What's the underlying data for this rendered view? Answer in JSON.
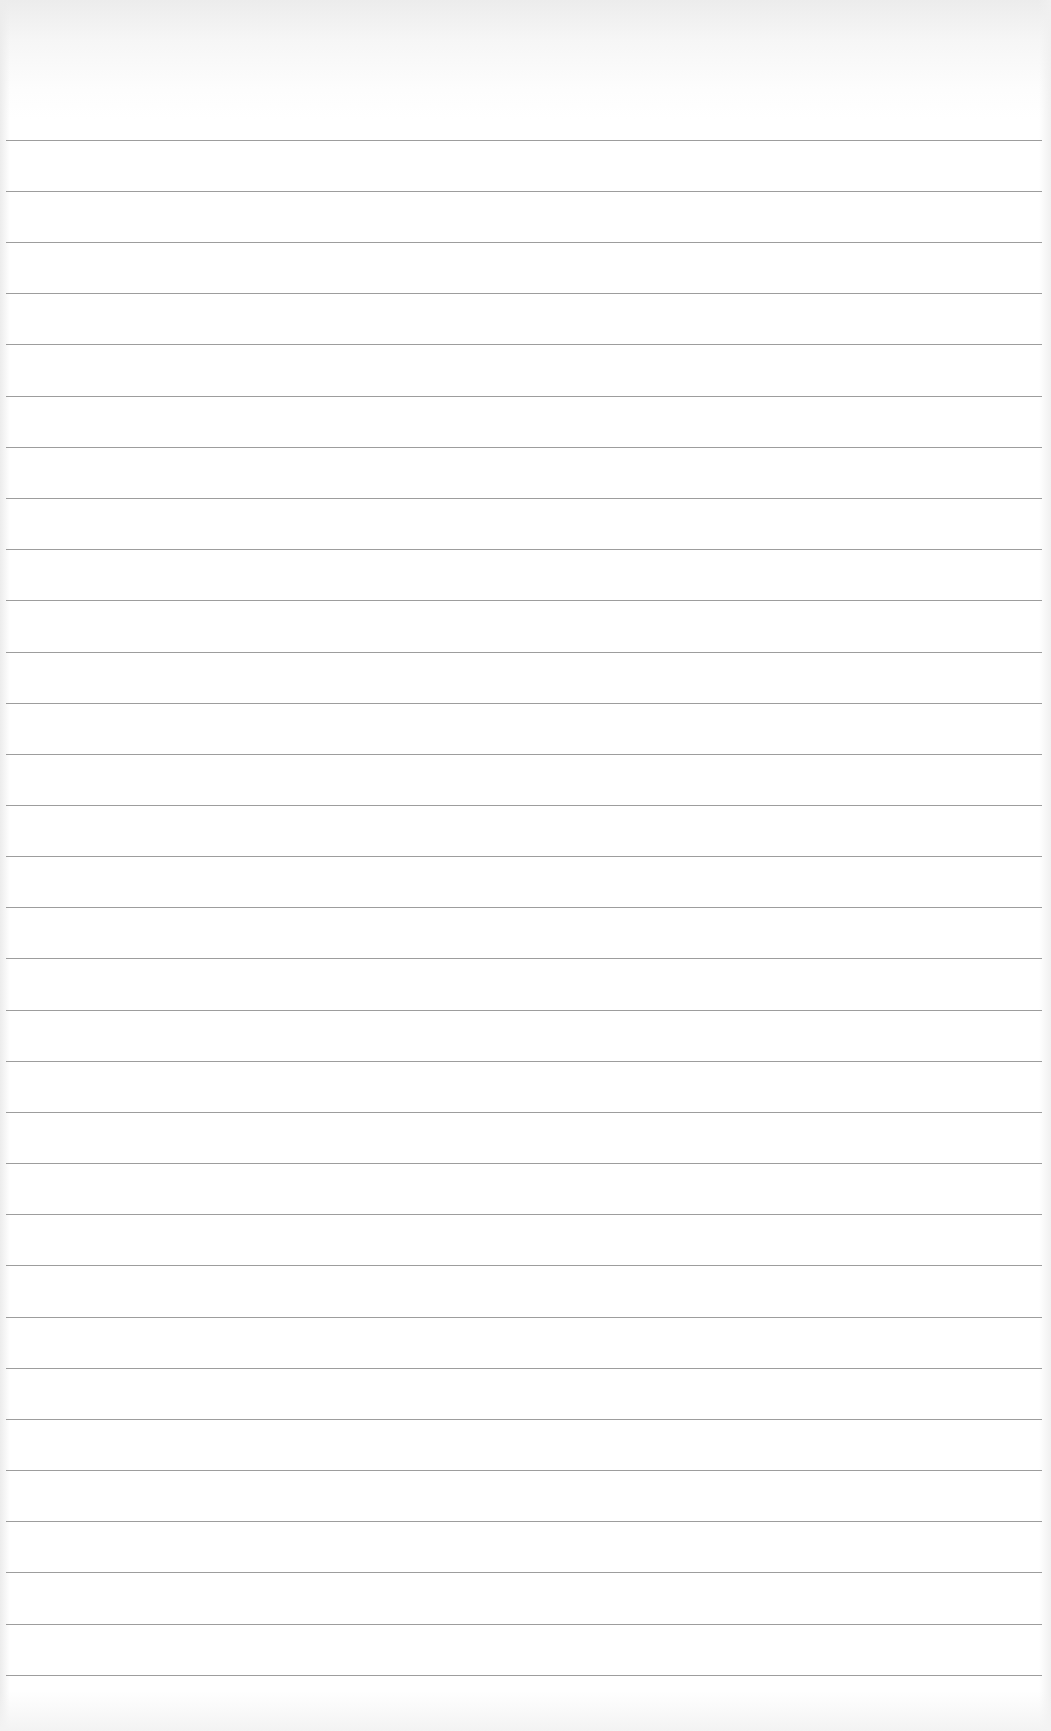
{
  "page": {
    "type": "lined-paper",
    "background_color": "#ffffff",
    "top_shade_color": "#ececec",
    "line_color": "#8c8c8c",
    "line_count": 31,
    "first_line_y": 140,
    "line_spacing": 51.15
  },
  "rules": [
    {
      "y": 140
    },
    {
      "y": 191
    },
    {
      "y": 242
    },
    {
      "y": 293
    },
    {
      "y": 344
    },
    {
      "y": 396
    },
    {
      "y": 447
    },
    {
      "y": 498
    },
    {
      "y": 549
    },
    {
      "y": 600
    },
    {
      "y": 652
    },
    {
      "y": 703
    },
    {
      "y": 754
    },
    {
      "y": 805
    },
    {
      "y": 856
    },
    {
      "y": 907
    },
    {
      "y": 958
    },
    {
      "y": 1010
    },
    {
      "y": 1061
    },
    {
      "y": 1112
    },
    {
      "y": 1163
    },
    {
      "y": 1214
    },
    {
      "y": 1265
    },
    {
      "y": 1317
    },
    {
      "y": 1368
    },
    {
      "y": 1419
    },
    {
      "y": 1470
    },
    {
      "y": 1521
    },
    {
      "y": 1572
    },
    {
      "y": 1624
    },
    {
      "y": 1675
    }
  ]
}
